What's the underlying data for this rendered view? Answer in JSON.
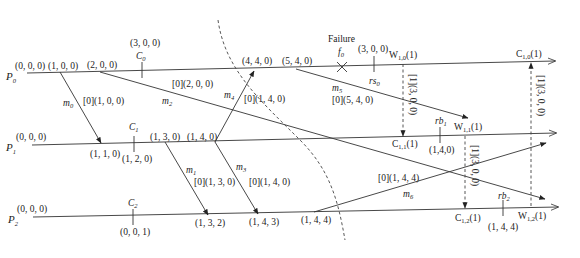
{
  "processes": [
    {
      "name": "P",
      "sub": "0",
      "init": "(0, 0, 0)"
    },
    {
      "name": "P",
      "sub": "1",
      "init": "(0, 0, 0)"
    },
    {
      "name": "P",
      "sub": "2",
      "init": "(0, 0, 0)"
    }
  ],
  "p0_events": {
    "e1": "(1, 0, 0)",
    "e2": "(2, 0, 0)",
    "c0_vec": "(3, 0, 0)",
    "c0_label": "C",
    "c0_sub": "0",
    "e4": "(4, 4, 0)",
    "e5": "(5, 4, 0)",
    "failure": "Failure",
    "f_label": "f",
    "f_sub": "0",
    "rs_vec": "(3, 0, 0)",
    "rs_label": "rs",
    "rs_sub": "0",
    "w10": "W",
    "w10_sub": "1,0",
    "w10_arg": "(1)",
    "c10": "C",
    "c10_sub": "1,0",
    "c10_arg": "(1)"
  },
  "p1_events": {
    "e1": "(1, 1, 0)",
    "c1_label": "C",
    "c1_sub": "1",
    "c1_vec": "(1, 2, 0)",
    "e3": "(1, 3, 0)",
    "e4": "(1, 4, 0)",
    "c11": "C",
    "c11_sub": "1,1",
    "c11_arg": "(1)",
    "rb_label": "rb",
    "rb_sub": "1",
    "rb_vec": "(1,4,0)",
    "w11": "W",
    "w11_sub": "1,1",
    "w11_arg": "(1)"
  },
  "p2_events": {
    "c2_label": "C",
    "c2_sub": "2",
    "c2_vec": "(0, 0, 1)",
    "e2": "(1, 3, 2)",
    "e3": "(1, 4, 3)",
    "e4": "(1, 4, 4)",
    "c12": "C",
    "c12_sub": "1,2",
    "c12_arg": "(1)",
    "rb_label": "rb",
    "rb_sub": "2",
    "rb_vec": "(1, 4, 4)",
    "w12": "W",
    "w12_sub": "1,2",
    "w12_arg": "(1)"
  },
  "messages": {
    "m0": {
      "name": "m",
      "sub": "0",
      "tag": "[0](1, 0, 0)"
    },
    "m1": {
      "name": "m",
      "sub": "1",
      "tag": "[0](1, 3, 0)"
    },
    "m2": {
      "name": "m",
      "sub": "2",
      "tag": "[0](2, 0, 0)"
    },
    "m3": {
      "name": "m",
      "sub": "3",
      "tag": "[0](1, 4, 0)"
    },
    "m4": {
      "name": "m",
      "sub": "4",
      "tag": "[0](1, 4, 0)"
    },
    "m5": {
      "name": "m",
      "sub": "5",
      "tag": "[0](5, 4, 0)"
    },
    "m6": {
      "name": "m",
      "sub": "6",
      "tag": "[0](1, 4, 4)"
    }
  },
  "control_messages": {
    "to_p1": "[1](3, 0, 0)",
    "to_p2": "[1](3, 0, 0)",
    "to_p0": "[1](3, 0, 0)"
  }
}
